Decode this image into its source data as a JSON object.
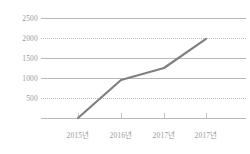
{
  "chart_data": {
    "type": "line",
    "title": "",
    "subtitle": "",
    "xlabel": "",
    "ylabel": "",
    "categories": [
      "2015년",
      "2016년",
      "2017년",
      "2017년"
    ],
    "values": [
      0,
      950,
      1250,
      1980
    ],
    "series": [
      {
        "name": "",
        "values": [
          0,
          950,
          1250,
          1980
        ]
      }
    ],
    "ylim": [
      0,
      2500
    ],
    "yticks": [
      0,
      500,
      1000,
      1500,
      2000,
      2500
    ],
    "ytick_labels": [
      "",
      "500",
      "1000",
      "1500",
      "2000",
      "2500"
    ],
    "grid": true,
    "gridline_styles": {
      "2500": "solid",
      "2000": "dotted",
      "1500": "solid",
      "1000": "solid",
      "500": "dotted",
      "0": "solid"
    },
    "legend": "none",
    "legend_position": "none",
    "line_color": "#808080",
    "grid_color": "#b9b9b9",
    "label_color": "#9a9a9a",
    "background_color": "#ffffff"
  },
  "axis": {
    "y_labels": [
      {
        "text": "2500",
        "value": 2500
      },
      {
        "text": "2000",
        "value": 2000
      },
      {
        "text": "1500",
        "value": 1500
      },
      {
        "text": "1000",
        "value": 1000
      },
      {
        "text": "500",
        "value": 500
      }
    ],
    "x_labels": [
      {
        "text": "2015년"
      },
      {
        "text": "2016년"
      },
      {
        "text": "2017년"
      },
      {
        "text": "2017년"
      }
    ]
  }
}
